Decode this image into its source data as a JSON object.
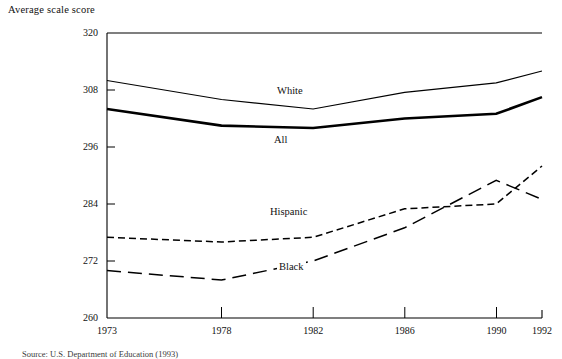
{
  "figure": {
    "y_axis_title": "Average scale score",
    "source_note": "Source: U.S. Department of Education (1993)"
  },
  "labels": {
    "white": "White",
    "all": "All",
    "hispanic": "Hispanic",
    "black": "Black"
  },
  "yticks": {
    "t0": "320",
    "t1": "308",
    "t2": "296",
    "t3": "284",
    "t4": "272",
    "t5": "260"
  },
  "xticks": {
    "t0": "1973",
    "t1": "1978",
    "t2": "1982",
    "t3": "1986",
    "t4": "1990",
    "t5": "1992"
  },
  "colors": {
    "axis": "#000000",
    "line": "#000000",
    "background": "#ffffff"
  },
  "chart_data": {
    "type": "line",
    "title": "",
    "subtitle": "",
    "xlabel": "",
    "ylabel": "Average scale score",
    "x": [
      1973,
      1978,
      1982,
      1986,
      1990,
      1992
    ],
    "xlim": [
      1973,
      1992
    ],
    "ylim": [
      260,
      320
    ],
    "yticks": [
      260,
      272,
      284,
      296,
      308,
      320
    ],
    "xticks": [
      1973,
      1978,
      1982,
      1986,
      1990,
      1992
    ],
    "grid": false,
    "legend": "inline-annotations",
    "series": [
      {
        "name": "White",
        "style": "solid-thin",
        "values": [
          310.0,
          306.0,
          304.0,
          307.5,
          309.5,
          312.0
        ]
      },
      {
        "name": "All",
        "style": "solid-thick",
        "values": [
          304.0,
          300.5,
          300.0,
          302.0,
          303.0,
          306.5
        ]
      },
      {
        "name": "Hispanic",
        "style": "dashed-short",
        "values": [
          277.0,
          276.0,
          277.0,
          283.0,
          284.0,
          292.0
        ]
      },
      {
        "name": "Black",
        "style": "dashed-long",
        "values": [
          270.0,
          268.0,
          272.0,
          279.0,
          289.0,
          285.0
        ]
      }
    ],
    "annotations": [
      {
        "text": "White",
        "x": 1983.2,
        "y": 308.0
      },
      {
        "text": "All",
        "x": 1983.0,
        "y": 297.5
      },
      {
        "text": "Hispanic",
        "x": 1982.7,
        "y": 283.5
      },
      {
        "text": "Black",
        "x": 1983.6,
        "y": 270.5
      }
    ]
  }
}
